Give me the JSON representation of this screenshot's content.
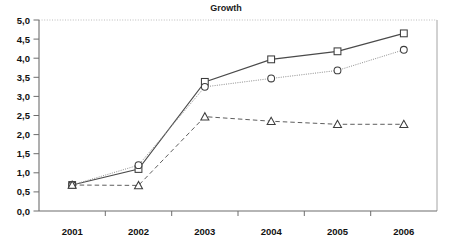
{
  "chart_data": {
    "type": "line",
    "title": "Growth",
    "xlabel": "",
    "ylabel": "",
    "categories": [
      "2001",
      "2002",
      "2003",
      "2004",
      "2005",
      "2006"
    ],
    "ylim": [
      0,
      5
    ],
    "ytick_step": 0.5,
    "ytick_labels": [
      "0,0",
      "0,5",
      "1,0",
      "1,5",
      "2,0",
      "2,5",
      "3,0",
      "3,5",
      "4,0",
      "4,5",
      "5,0"
    ],
    "ytick_values": [
      0,
      0.5,
      1,
      1.5,
      2,
      2.5,
      3,
      3.5,
      4,
      4.5,
      5
    ],
    "decimal_separator": ",",
    "grid": "top-gridline-only",
    "legend": "none",
    "series": [
      {
        "name": "series-square",
        "marker": "square",
        "line_style": "solid",
        "color": "#4a4a4a",
        "values": [
          0.68,
          1.1,
          3.38,
          3.97,
          4.18,
          4.65
        ]
      },
      {
        "name": "series-circle",
        "marker": "circle",
        "line_style": "dotted",
        "color": "#8e8e8e",
        "values": [
          0.68,
          1.2,
          3.25,
          3.47,
          3.68,
          4.22
        ]
      },
      {
        "name": "series-triangle",
        "marker": "triangle",
        "line_style": "dashed",
        "color": "#5e5e5e",
        "values": [
          0.68,
          0.67,
          2.47,
          2.35,
          2.27,
          2.27
        ]
      }
    ]
  },
  "axes": {
    "y_tick_0": "0,0",
    "y_tick_1": "0,5",
    "y_tick_2": "1,0",
    "y_tick_3": "1,5",
    "y_tick_4": "2,0",
    "y_tick_5": "2,5",
    "y_tick_6": "3,0",
    "y_tick_7": "3,5",
    "y_tick_8": "4,0",
    "y_tick_9": "4,5",
    "y_tick_10": "5,0",
    "x_tick_0": "2001",
    "x_tick_1": "2002",
    "x_tick_2": "2003",
    "x_tick_3": "2004",
    "x_tick_4": "2005",
    "x_tick_5": "2006"
  },
  "colors": {
    "background": "#ffffff",
    "axis": "#6d6d6d",
    "frame": "#9a9a9a",
    "text": "#111111",
    "series_square": "#4a4a4a",
    "series_circle": "#8e8e8e",
    "series_triangle": "#5e5e5e"
  }
}
